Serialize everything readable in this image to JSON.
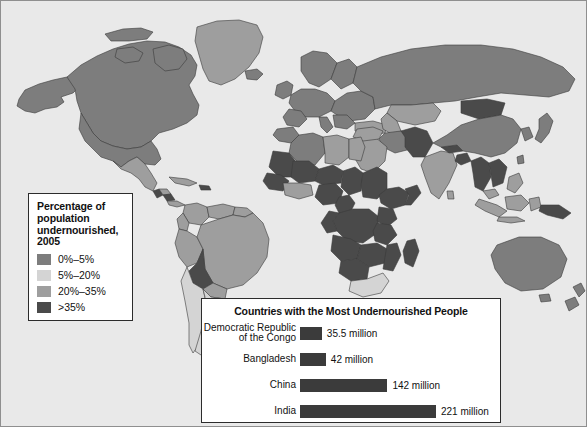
{
  "figure": {
    "background_color": "#e9e9e9",
    "border_color": "#8f8f8f"
  },
  "legend": {
    "title": "Percentage of population undernourished, 2005",
    "title_lines": [
      "Percentage of",
      "population",
      "undernourished,",
      "2005"
    ],
    "items": [
      {
        "label": "0%–5%",
        "color": "#7d7d7d"
      },
      {
        "label": "5%–20%",
        "color": "#d4d4d4"
      },
      {
        "label": "20%–35%",
        "color": "#9e9e9e"
      },
      {
        "label": ">35%",
        "color": "#4a4a4a"
      }
    ]
  },
  "chart_data": {
    "type": "bar",
    "title": "Countries with the Most Undernourished People",
    "xlabel": "",
    "ylabel": "",
    "orientation": "horizontal",
    "unit": "million",
    "grid": false,
    "legend_position": "none",
    "bar_color": "#3b3b3b",
    "xlim": [
      0,
      221
    ],
    "categories": [
      "Democratic Republic of the Congo",
      "Bangladesh",
      "China",
      "India"
    ],
    "category_lines": [
      [
        "Democratic Republic",
        "of the Congo"
      ],
      [
        "Bangladesh"
      ],
      [
        "China"
      ],
      [
        "India"
      ]
    ],
    "values": [
      35.5,
      42,
      142,
      221
    ],
    "value_labels": [
      "35.5 million",
      "42 million",
      "142 million",
      "221 million"
    ]
  },
  "map": {
    "ocean_color": "#e9e9e9",
    "border_color": "#3a3a3a",
    "categories": {
      "low": "#7d7d7d",
      "lowmid": "#d4d4d4",
      "mid": "#9e9e9e",
      "high": "#4a4a4a"
    }
  }
}
